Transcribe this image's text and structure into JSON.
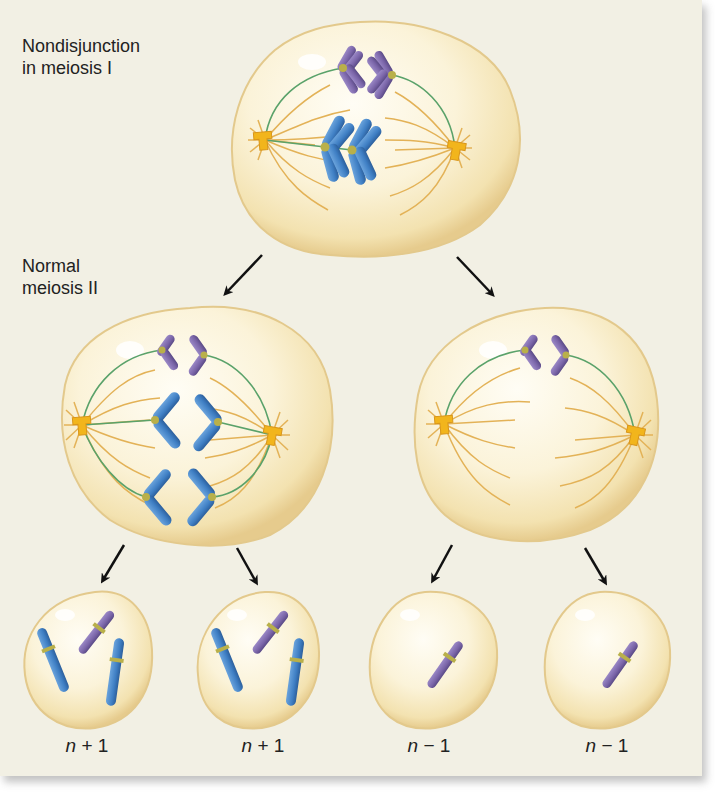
{
  "figure": {
    "title_top": {
      "line1": "Nondisjunction",
      "line2": "in meiosis I"
    },
    "title_middle": {
      "line1": "Normal",
      "line2": "meiosis II"
    },
    "outcomes": [
      {
        "var": "n",
        "op": " + ",
        "num": "1"
      },
      {
        "var": "n",
        "op": " + ",
        "num": "1"
      },
      {
        "var": "n",
        "op": " − ",
        "num": "1"
      },
      {
        "var": "n",
        "op": " − ",
        "num": "1"
      }
    ]
  },
  "colors": {
    "background": "#f2f0e4",
    "cell_fill": "#fbf3d8",
    "cell_edge": "#e3c98c",
    "blue_chromosome": "#3f7fc4",
    "purple_chromosome": "#7a65a8",
    "centromere": "#b9b04a",
    "spindle_fiber": "#e3b257",
    "kinetochore_fiber": "#5aa26a",
    "centrosome": "#f2b51c",
    "arrow": "#111111"
  }
}
